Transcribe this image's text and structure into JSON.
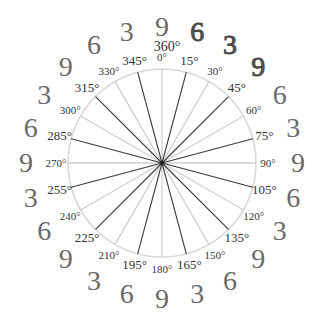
{
  "diagram": {
    "center": {
      "x": 162,
      "y": 163
    },
    "circle_radius": 94,
    "circle_color": "#d8d8d8",
    "spoke_dark_color": "#3a3a3a",
    "spoke_light_color": "#cfcfcf",
    "top_extra_label": "360°",
    "spokes": [
      {
        "angle": 0,
        "label": "0°",
        "style": "light"
      },
      {
        "angle": 15,
        "label": "15°",
        "style": "dark"
      },
      {
        "angle": 30,
        "label": "30°",
        "style": "light"
      },
      {
        "angle": 45,
        "label": "45°",
        "style": "dark"
      },
      {
        "angle": 60,
        "label": "60°",
        "style": "light"
      },
      {
        "angle": 75,
        "label": "75°",
        "style": "dark"
      },
      {
        "angle": 90,
        "label": "90°",
        "style": "light"
      },
      {
        "angle": 105,
        "label": "105°",
        "style": "dark"
      },
      {
        "angle": 120,
        "label": "120°",
        "style": "light"
      },
      {
        "angle": 135,
        "label": "135°",
        "style": "dark"
      },
      {
        "angle": 150,
        "label": "150°",
        "style": "light"
      },
      {
        "angle": 165,
        "label": "165°",
        "style": "dark"
      },
      {
        "angle": 180,
        "label": "180°",
        "style": "light"
      },
      {
        "angle": 195,
        "label": "195°",
        "style": "dark"
      },
      {
        "angle": 210,
        "label": "210°",
        "style": "light"
      },
      {
        "angle": 225,
        "label": "225°",
        "style": "dark"
      },
      {
        "angle": 240,
        "label": "240°",
        "style": "light"
      },
      {
        "angle": 255,
        "label": "255°",
        "style": "dark"
      },
      {
        "angle": 270,
        "label": "270°",
        "style": "light"
      },
      {
        "angle": 285,
        "label": "285°",
        "style": "dark"
      },
      {
        "angle": 300,
        "label": "300°",
        "style": "light"
      },
      {
        "angle": 315,
        "label": "315°",
        "style": "dark"
      },
      {
        "angle": 330,
        "label": "330°",
        "style": "light"
      },
      {
        "angle": 345,
        "label": "345°",
        "style": "dark"
      }
    ],
    "outer_digits": [
      {
        "angle": 0,
        "digit": "9",
        "bold": false
      },
      {
        "angle": 15,
        "digit": "6",
        "bold": true
      },
      {
        "angle": 30,
        "digit": "3",
        "bold": true
      },
      {
        "angle": 45,
        "digit": "9",
        "bold": true
      },
      {
        "angle": 60,
        "digit": "6",
        "bold": false
      },
      {
        "angle": 75,
        "digit": "3",
        "bold": false
      },
      {
        "angle": 90,
        "digit": "9",
        "bold": false
      },
      {
        "angle": 105,
        "digit": "6",
        "bold": false
      },
      {
        "angle": 120,
        "digit": "3",
        "bold": false
      },
      {
        "angle": 135,
        "digit": "9",
        "bold": false
      },
      {
        "angle": 150,
        "digit": "6",
        "bold": false
      },
      {
        "angle": 165,
        "digit": "3",
        "bold": false
      },
      {
        "angle": 180,
        "digit": "9",
        "bold": false
      },
      {
        "angle": 195,
        "digit": "6",
        "bold": false
      },
      {
        "angle": 210,
        "digit": "3",
        "bold": false
      },
      {
        "angle": 225,
        "digit": "9",
        "bold": false
      },
      {
        "angle": 240,
        "digit": "6",
        "bold": false
      },
      {
        "angle": 255,
        "digit": "3",
        "bold": false
      },
      {
        "angle": 270,
        "digit": "9",
        "bold": false
      },
      {
        "angle": 285,
        "digit": "6",
        "bold": false
      },
      {
        "angle": 300,
        "digit": "3",
        "bold": false
      },
      {
        "angle": 315,
        "digit": "9",
        "bold": false
      },
      {
        "angle": 330,
        "digit": "6",
        "bold": false
      },
      {
        "angle": 345,
        "digit": "3",
        "bold": false
      }
    ]
  }
}
